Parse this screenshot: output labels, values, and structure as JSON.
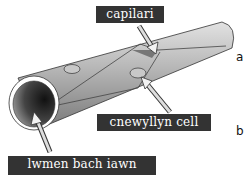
{
  "diagram": {
    "labels": {
      "capillary": "capilari",
      "nucleus": "cnewyllyn cell",
      "lumen": "lwmen bach iawn"
    },
    "side_letters": {
      "a": "a",
      "b": "b"
    },
    "colors": {
      "label_bg": "#333333",
      "label_text": "#ffffff",
      "tube_light": "#d0d0d0",
      "tube_mid": "#a8a8a8",
      "tube_dark": "#6a6a6a",
      "lumen_dark": "#1a1a1a",
      "arrow_fill": "#e0e0e0"
    }
  }
}
